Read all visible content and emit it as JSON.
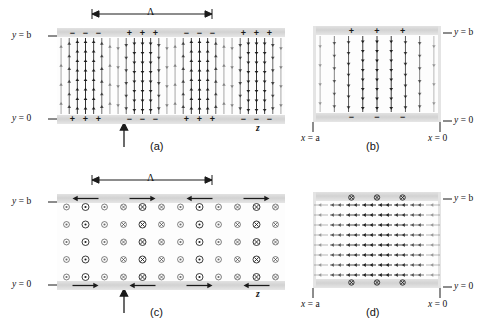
{
  "figure": {
    "background": "#ffffff",
    "ink": "#1b1b1b",
    "band_color": "#dcdcdc"
  },
  "panels": [
    {
      "id": "a",
      "caption": "(a)",
      "view": "longitudinal",
      "field": "electric",
      "axis_labels": [
        {
          "name": "y-top",
          "text": "y = b"
        },
        {
          "name": "y-bottom",
          "text": "y = 0"
        },
        {
          "name": "z-axis",
          "text": "z"
        }
      ],
      "period_label": "Λ",
      "period_marker": true,
      "propagation_marker": true,
      "top_charges": [
        "−",
        "+",
        "−",
        "+"
      ],
      "bottom_charges": [
        "+",
        "−",
        "+",
        "−"
      ],
      "arrow_direction_groups": [
        "up",
        "down",
        "up",
        "down"
      ],
      "group_count": 4
    },
    {
      "id": "b",
      "caption": "(b)",
      "view": "cross-section",
      "field": "electric",
      "axis_labels": [
        {
          "name": "y-top",
          "text": "y = b"
        },
        {
          "name": "y-bottom",
          "text": "y = 0"
        },
        {
          "name": "x-left",
          "text": "x = a"
        },
        {
          "name": "x-right",
          "text": "x = 0"
        }
      ],
      "top_charges": [
        "+",
        "+",
        "+"
      ],
      "bottom_charges": [
        "−",
        "−",
        "−"
      ],
      "arrow_direction": "down",
      "line_count": 9
    },
    {
      "id": "c",
      "caption": "(c)",
      "view": "longitudinal",
      "field": "magnetic",
      "axis_labels": [
        {
          "name": "y-top",
          "text": "y = b"
        },
        {
          "name": "y-bottom",
          "text": "y = 0"
        },
        {
          "name": "z-axis",
          "text": "z"
        }
      ],
      "period_label": "Λ",
      "period_marker": true,
      "propagation_marker": true,
      "top_surface_arrows": [
        "left",
        "right",
        "left",
        "right"
      ],
      "bottom_surface_arrows": [
        "right",
        "left",
        "right",
        "left"
      ],
      "symbol_groups": [
        "out-of-page",
        "into-page",
        "out-of-page",
        "into-page"
      ],
      "rows": 5
    },
    {
      "id": "d",
      "caption": "(d)",
      "view": "cross-section",
      "field": "magnetic",
      "axis_labels": [
        {
          "name": "y-top",
          "text": "y = b"
        },
        {
          "name": "y-bottom",
          "text": "y = 0"
        },
        {
          "name": "x-left",
          "text": "x = a"
        },
        {
          "name": "x-right",
          "text": "x = 0"
        }
      ],
      "top_symbols": [
        "into-page",
        "into-page",
        "into-page"
      ],
      "bottom_symbols": [
        "into-page",
        "into-page",
        "into-page"
      ],
      "arrow_direction": "left",
      "row_count": 8
    }
  ],
  "legend": {
    "out_of_page_glyph": "⊙",
    "into_page_glyph": "⊗",
    "plus_glyph": "+",
    "minus_glyph": "−"
  }
}
